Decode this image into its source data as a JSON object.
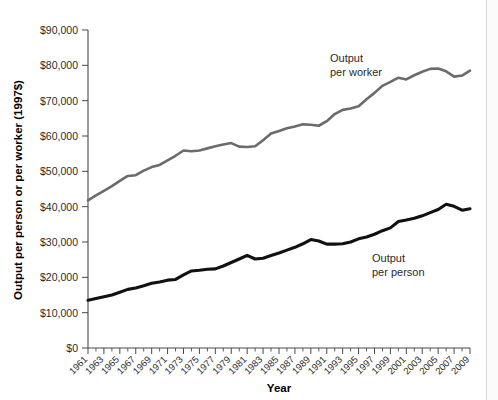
{
  "chart_data": {
    "type": "line",
    "title": "",
    "xlabel": "Year",
    "ylabel": "Output per person or per worker (1997$)",
    "xlim": [
      1961,
      2009
    ],
    "ylim": [
      0,
      90000
    ],
    "grid": false,
    "legend_position": "inline-annotation",
    "y_ticks": [
      0,
      10000,
      20000,
      30000,
      40000,
      50000,
      60000,
      70000,
      80000,
      90000
    ],
    "y_tick_labels": [
      "$0",
      "$10,000",
      "$20,000",
      "$30,000",
      "$40,000",
      "$50,000",
      "$60,000",
      "$70,000",
      "$80,000",
      "$90,000"
    ],
    "x_tick_labels": [
      "1961",
      "1963",
      "1965",
      "1967",
      "1969",
      "1971",
      "1973",
      "1975",
      "1977",
      "1979",
      "1981",
      "1983",
      "1985",
      "1987",
      "1989",
      "1991",
      "1993",
      "1995",
      "1997",
      "1999",
      "2001",
      "2003",
      "2005",
      "2007",
      "2009"
    ],
    "x": [
      1961,
      1962,
      1963,
      1964,
      1965,
      1966,
      1967,
      1968,
      1969,
      1970,
      1971,
      1972,
      1973,
      1974,
      1975,
      1976,
      1977,
      1978,
      1979,
      1980,
      1981,
      1982,
      1983,
      1984,
      1985,
      1986,
      1987,
      1988,
      1989,
      1990,
      1991,
      1992,
      1993,
      1994,
      1995,
      1996,
      1997,
      1998,
      1999,
      2000,
      2001,
      2002,
      2003,
      2004,
      2005,
      2006,
      2007,
      2008,
      2009
    ],
    "series": [
      {
        "name": "Output per worker",
        "color": "#6b6b6b",
        "annotation": "Output\nper worker",
        "values": [
          41800,
          43200,
          44500,
          45800,
          47300,
          48700,
          48900,
          50200,
          51200,
          51800,
          53100,
          54400,
          55900,
          55700,
          55900,
          56500,
          57100,
          57600,
          58000,
          57000,
          56900,
          57100,
          58800,
          60700,
          61400,
          62200,
          62700,
          63300,
          63200,
          62900,
          64200,
          66200,
          67400,
          67800,
          68400,
          70400,
          72200,
          74200,
          75300,
          76500,
          76000,
          77200,
          78200,
          79000,
          79100,
          78300,
          76800,
          77100,
          78500
        ]
      },
      {
        "name": "Output per person",
        "color": "#111111",
        "annotation": "Output\nper person",
        "values": [
          13500,
          14000,
          14500,
          15000,
          15800,
          16600,
          17000,
          17600,
          18300,
          18700,
          19200,
          19400,
          20700,
          21800,
          22000,
          22300,
          22400,
          23200,
          24200,
          25200,
          26200,
          25200,
          25400,
          26200,
          26900,
          27700,
          28500,
          29500,
          30700,
          30300,
          29400,
          29400,
          29500,
          30000,
          30900,
          31400,
          32200,
          33200,
          34000,
          35800,
          36200,
          36700,
          37400,
          38300,
          39200,
          40700,
          40100,
          39000,
          39400
        ]
      }
    ]
  },
  "axis": {
    "x_title": "Year",
    "y_title": "Output per person or per worker (1997$)"
  }
}
